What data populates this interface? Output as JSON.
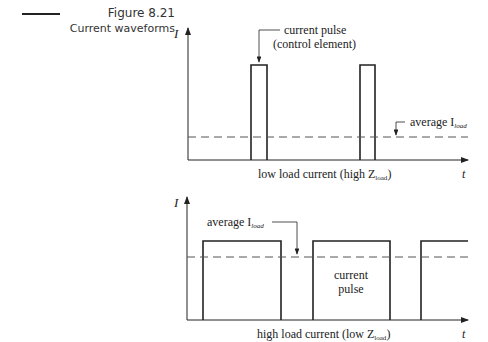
{
  "caption": {
    "figure_number": "Figure 8.21",
    "title": "Current waveforms"
  },
  "top_graph": {
    "y_axis_label": "I",
    "x_axis_label": "t",
    "pulse_label_line1": "current pulse",
    "pulse_label_line2": "(control element)",
    "average_label": "average I",
    "average_sub": "load",
    "caption_main": "low load current (high Z",
    "caption_sub": "load",
    "caption_end": ")"
  },
  "bottom_graph": {
    "y_axis_label": "I",
    "x_axis_label": "t",
    "average_label": "average I",
    "average_sub": "load",
    "pulse_label_line1": "current",
    "pulse_label_line2": "pulse",
    "caption_main": "high load current (low Z",
    "caption_sub": "load",
    "caption_end": ")"
  },
  "colors": {
    "line": "#222222",
    "dashed": "#555555"
  }
}
